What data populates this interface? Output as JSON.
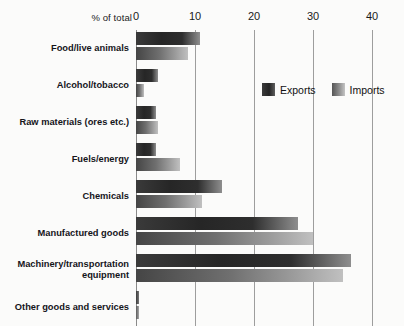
{
  "chart_data": {
    "type": "bar",
    "orientation": "horizontal",
    "title": "",
    "xlabel": "% of total",
    "ylabel": "",
    "xlim": [
      0,
      40
    ],
    "xticks": [
      0,
      10,
      20,
      30,
      40
    ],
    "xtick_labels": [
      "0",
      "10",
      "20",
      "30",
      "40"
    ],
    "grid": true,
    "legend_position": "upper-right-inside",
    "categories": [
      "Food/live animals",
      "Alcohol/tobacco",
      "Raw materials (ores etc.)",
      "Fuels/energy",
      "Chemicals",
      "Manufactured goods",
      "Machinery/transportation\nequipment",
      "Other goods and services"
    ],
    "series": [
      {
        "name": "Exports",
        "color": "#2b2b2b",
        "values": [
          10.8,
          3.7,
          3.4,
          3.4,
          14.5,
          27.5,
          36.5,
          0.5
        ]
      },
      {
        "name": "Imports",
        "color": "#9a9a9a",
        "values": [
          8.8,
          1.4,
          3.7,
          7.5,
          11.2,
          30.0,
          35.0,
          0.5
        ]
      }
    ]
  },
  "legend": {
    "items": [
      {
        "label": "Exports",
        "swatch": "exports-swatch"
      },
      {
        "label": "Imports",
        "swatch": "imports-swatch"
      }
    ]
  },
  "colors": {
    "background": "#fbfbfa",
    "gridline": "#9d9d9d",
    "text": "#1a1a1a"
  }
}
